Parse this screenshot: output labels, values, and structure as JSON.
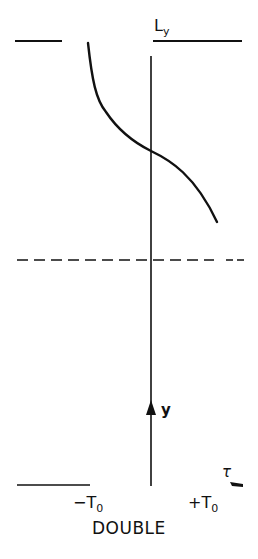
{
  "diagram": {
    "title": "DOUBLE",
    "top_label": "L",
    "top_label_sub": "y",
    "axis_label_y": "y",
    "axis_label_tau": "τ",
    "tick_neg": "−T",
    "tick_neg_sub": "0",
    "tick_pos": "+T",
    "tick_pos_sub": "0",
    "curve_description": "S-shaped profile descending from upper-left, crossing the vertical axis, to lower-right",
    "dashed_line_style": "dash-dot reference line"
  }
}
